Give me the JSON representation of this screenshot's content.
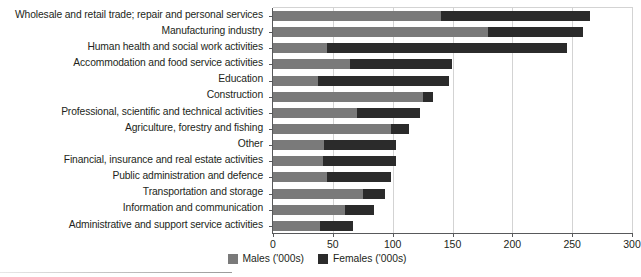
{
  "chart_data": {
    "type": "bar",
    "orientation": "horizontal",
    "stacked": true,
    "title": "",
    "subtitle": "",
    "xlabel": "",
    "ylabel": "",
    "xlim": [
      0,
      300
    ],
    "xticks": [
      0,
      50,
      100,
      150,
      200,
      250,
      300
    ],
    "xtick_labels": [
      "0",
      "50",
      "100",
      "150",
      "200",
      "250",
      "300"
    ],
    "grid": "vertical",
    "legend_position": "bottom-center",
    "categories": [
      "Wholesale and retail trade; repair and personal services",
      "Manufacturing industry",
      "Human health and social work activities",
      "Accommodation and food service activities",
      "Education",
      "Construction",
      "Professional, scientific and technical activities",
      "Agriculture, forestry and fishing",
      "Other",
      "Financial, insurance and real estate activities",
      "Public administration and defence",
      "Transportation and storage",
      "Information and communication",
      "Administrative and support service activities"
    ],
    "series": [
      {
        "name": "Males ('000s)",
        "color": "#7a7a7a",
        "values": [
          140,
          180,
          45,
          64,
          38,
          125,
          70,
          99,
          43,
          42,
          45,
          75,
          60,
          39
        ]
      },
      {
        "name": "Females ('000s)",
        "color": "#2b2b2b",
        "values": [
          125,
          79,
          201,
          86,
          109,
          9,
          53,
          15,
          60,
          61,
          54,
          19,
          24,
          28
        ]
      }
    ],
    "totals": [
      265,
      259,
      246,
      150,
      147,
      134,
      123,
      114,
      103,
      103,
      99,
      94,
      84,
      67
    ]
  },
  "legend": {
    "items": [
      {
        "label": "Males ('000s)",
        "swatch": "male-swatch"
      },
      {
        "label": "Females ('000s)",
        "swatch": "female-swatch"
      }
    ]
  },
  "colors": {
    "male": "#7a7a7a",
    "female": "#2b2b2b",
    "grid": "#d3d3d3",
    "axis": "#58595b",
    "text": "#231f20",
    "background": "#ffffff"
  }
}
